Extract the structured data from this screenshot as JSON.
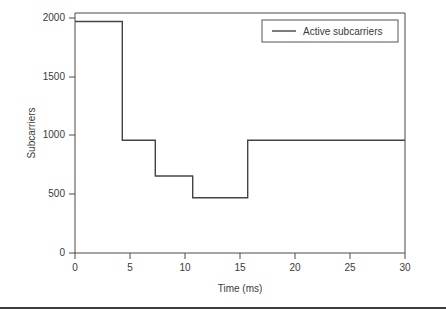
{
  "chart_data": {
    "type": "line",
    "subtype": "step-post",
    "title": "",
    "xlabel": "Time (ms)",
    "ylabel": "Subcarriers",
    "xlim": [
      0,
      30
    ],
    "ylim": [
      0,
      2000
    ],
    "xticks": [
      0,
      5,
      10,
      15,
      20,
      25,
      30
    ],
    "xtick_labels": [
      "0",
      "5",
      "10",
      "15",
      "20",
      "25",
      "30"
    ],
    "yticks": [
      0,
      500,
      1000,
      1500,
      2000
    ],
    "ytick_labels": [
      "0",
      "500",
      "1000",
      "1500",
      "2000"
    ],
    "grid": false,
    "legend_position": "upper right",
    "series": [
      {
        "name": "Active subcarriers",
        "color": "#444444",
        "x": [
          0,
          4.3,
          4.3,
          7.3,
          7.3,
          10.7,
          10.7,
          15.7,
          15.7,
          30
        ],
        "y": [
          1970,
          1970,
          960,
          960,
          655,
          655,
          470,
          470,
          960,
          960
        ],
        "steps": [
          {
            "t_start": 0,
            "t_end": 4.3,
            "value": 1970
          },
          {
            "t_start": 4.3,
            "t_end": 7.3,
            "value": 960
          },
          {
            "t_start": 7.3,
            "t_end": 10.7,
            "value": 655
          },
          {
            "t_start": 10.7,
            "t_end": 15.7,
            "value": 470
          },
          {
            "t_start": 15.7,
            "t_end": 30,
            "value": 960
          }
        ]
      }
    ],
    "legend": [
      {
        "label": "Active subcarriers",
        "color": "#444444"
      }
    ]
  },
  "colors": {
    "line": "#444444",
    "axis": "#4a4a4a",
    "text": "#3a3a3a",
    "background": "#ffffff",
    "rule": "#3c3c3c"
  }
}
